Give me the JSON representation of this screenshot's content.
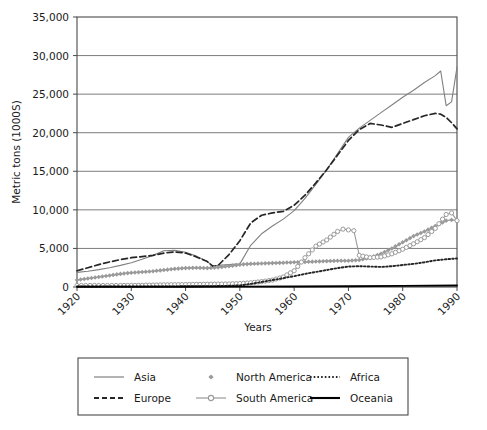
{
  "chart_data": {
    "type": "line",
    "title": "",
    "xlabel": "Years",
    "ylabel": "Metric tons (1000S)",
    "xlim": [
      1920,
      1990
    ],
    "ylim": [
      0,
      35000
    ],
    "grid": true,
    "legend_position": "bottom",
    "ytick_labels": [
      "0",
      "5,000",
      "10,000",
      "15,000",
      "20,000",
      "25,000",
      "30,000",
      "35,000"
    ],
    "ytick_values": [
      0,
      5000,
      10000,
      15000,
      20000,
      25000,
      30000,
      35000
    ],
    "xtick_labels": [
      "1920",
      "1930",
      "1940",
      "1950",
      "1960",
      "1970",
      "1980",
      "1990"
    ],
    "xtick_values": [
      1920,
      1930,
      1940,
      1950,
      1960,
      1970,
      1980,
      1990
    ],
    "series": [
      {
        "name": "Asia",
        "style": "solid",
        "color": "#808080",
        "marker": "none",
        "x": [
          1920,
          1922,
          1924,
          1926,
          1928,
          1930,
          1932,
          1934,
          1936,
          1938,
          1940,
          1942,
          1944,
          1945,
          1946,
          1948,
          1950,
          1952,
          1954,
          1956,
          1958,
          1960,
          1962,
          1964,
          1966,
          1968,
          1970,
          1972,
          1974,
          1976,
          1978,
          1980,
          1982,
          1984,
          1986,
          1987,
          1988,
          1989,
          1990
        ],
        "y": [
          1900,
          2050,
          2250,
          2500,
          2800,
          3150,
          3600,
          4100,
          4700,
          4750,
          4500,
          4000,
          3300,
          2700,
          2800,
          2900,
          3000,
          5400,
          6900,
          7900,
          8800,
          9900,
          11500,
          13300,
          15200,
          17300,
          19400,
          20600,
          21600,
          22600,
          23600,
          24600,
          25500,
          26500,
          27400,
          28000,
          23500,
          24000,
          28500
        ]
      },
      {
        "name": "Europe",
        "style": "dashed",
        "color": "#262626",
        "marker": "none",
        "x": [
          1920,
          1922,
          1924,
          1926,
          1928,
          1930,
          1932,
          1934,
          1936,
          1938,
          1940,
          1942,
          1944,
          1945,
          1946,
          1948,
          1950,
          1952,
          1954,
          1956,
          1958,
          1960,
          1962,
          1964,
          1966,
          1968,
          1970,
          1972,
          1974,
          1976,
          1978,
          1980,
          1982,
          1984,
          1986,
          1987,
          1988,
          1989,
          1990
        ],
        "y": [
          2100,
          2500,
          2900,
          3250,
          3550,
          3800,
          3950,
          4100,
          4400,
          4550,
          4400,
          3900,
          3300,
          2700,
          2800,
          4200,
          6000,
          8300,
          9300,
          9600,
          9800,
          10600,
          11900,
          13500,
          15200,
          17100,
          19000,
          20400,
          21200,
          21000,
          20700,
          21200,
          21700,
          22200,
          22500,
          22400,
          22000,
          21300,
          20500
        ]
      },
      {
        "name": "North America",
        "style": "solid",
        "color": "#9a9a9a",
        "marker": "diamond",
        "x": [
          1920,
          1922,
          1924,
          1926,
          1928,
          1930,
          1932,
          1934,
          1936,
          1938,
          1940,
          1942,
          1944,
          1946,
          1948,
          1950,
          1952,
          1954,
          1956,
          1958,
          1960,
          1962,
          1964,
          1966,
          1968,
          1970,
          1972,
          1974,
          1976,
          1978,
          1980,
          1982,
          1984,
          1986,
          1988,
          1989,
          1990
        ],
        "y": [
          900,
          1100,
          1300,
          1500,
          1700,
          1850,
          1950,
          2050,
          2200,
          2350,
          2450,
          2500,
          2450,
          2550,
          2700,
          2900,
          3000,
          3050,
          3100,
          3150,
          3200,
          3250,
          3300,
          3350,
          3400,
          3400,
          3500,
          3800,
          4300,
          5000,
          5800,
          6600,
          7200,
          7900,
          8600,
          8700,
          8600
        ]
      },
      {
        "name": "South America",
        "style": "solid",
        "color": "#9a9a9a",
        "marker": "circle",
        "x": [
          1920,
          1924,
          1928,
          1930,
          1932,
          1934,
          1936,
          1938,
          1940,
          1942,
          1944,
          1946,
          1948,
          1950,
          1952,
          1954,
          1956,
          1958,
          1960,
          1962,
          1964,
          1966,
          1968,
          1969,
          1970,
          1971,
          1972,
          1974,
          1976,
          1978,
          1980,
          1982,
          1984,
          1986,
          1988,
          1989,
          1990
        ],
        "y": [
          200,
          200,
          200,
          200,
          220,
          250,
          280,
          300,
          320,
          340,
          360,
          380,
          400,
          450,
          550,
          700,
          900,
          1300,
          2100,
          3800,
          5300,
          6100,
          7200,
          7500,
          7400,
          7300,
          4100,
          3800,
          3900,
          4300,
          4900,
          5600,
          6400,
          7600,
          9400,
          9600,
          8600
        ]
      },
      {
        "name": "Africa",
        "style": "dotted",
        "color": "#262626",
        "marker": "none",
        "x": [
          1920,
          1930,
          1940,
          1946,
          1950,
          1952,
          1954,
          1956,
          1958,
          1960,
          1962,
          1964,
          1966,
          1968,
          1970,
          1972,
          1974,
          1976,
          1978,
          1980,
          1982,
          1984,
          1986,
          1988,
          1990
        ],
        "y": [
          60,
          70,
          90,
          120,
          200,
          400,
          650,
          900,
          1150,
          1400,
          1700,
          1950,
          2200,
          2450,
          2650,
          2700,
          2650,
          2600,
          2700,
          2850,
          3000,
          3200,
          3450,
          3600,
          3700
        ]
      },
      {
        "name": "Oceania",
        "style": "solid-thick",
        "color": "#000000",
        "marker": "none",
        "x": [
          1920,
          1930,
          1940,
          1950,
          1960,
          1970,
          1980,
          1990
        ],
        "y": [
          30,
          35,
          40,
          50,
          70,
          100,
          140,
          200
        ]
      }
    ]
  },
  "legend": {
    "items": [
      {
        "label": "Asia",
        "swatch": "line-solid-gray"
      },
      {
        "label": "North America",
        "swatch": "marker-diamond"
      },
      {
        "label": "Africa",
        "swatch": "line-dotted"
      },
      {
        "label": "Europe",
        "swatch": "line-dashed"
      },
      {
        "label": "South America",
        "swatch": "line-circle-marker"
      },
      {
        "label": "Oceania",
        "swatch": "line-solid-black"
      }
    ]
  }
}
